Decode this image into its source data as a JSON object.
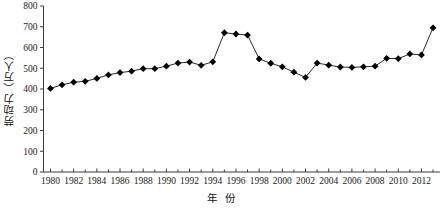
{
  "chart_data": {
    "type": "line",
    "title": "",
    "xlabel": "年 份",
    "ylabel": "劳动力（万人）",
    "ylim": [
      0,
      800
    ],
    "xlim": [
      1979.4,
      2013.6
    ],
    "grid": false,
    "legend": "none",
    "marker": "filled-diamond",
    "y_ticks": [
      0,
      100,
      200,
      300,
      400,
      500,
      600,
      700,
      800
    ],
    "x_ticks": [
      1980,
      1982,
      1984,
      1986,
      1988,
      1990,
      1992,
      1994,
      1996,
      1998,
      2000,
      2002,
      2004,
      2006,
      2008,
      2010,
      2012
    ],
    "x_tick_labels": [
      "1980",
      "1982",
      "1984",
      "1986",
      "1988",
      "1990",
      "1992",
      "1994",
      "1996",
      "1998",
      "2000",
      "2002",
      "2004",
      "2006",
      "2008",
      "2010",
      "2012"
    ],
    "y_tick_labels": [
      "0",
      "100",
      "200",
      "300",
      "400",
      "500",
      "600",
      "700",
      "800"
    ],
    "x": [
      1980,
      1981,
      1982,
      1983,
      1984,
      1985,
      1986,
      1987,
      1988,
      1989,
      1990,
      1991,
      1992,
      1993,
      1994,
      1995,
      1996,
      1997,
      1998,
      1999,
      2000,
      2001,
      2002,
      2003,
      2004,
      2005,
      2006,
      2007,
      2008,
      2009,
      2010,
      2011,
      2012,
      2013
    ],
    "values": [
      403,
      420,
      433,
      437,
      451,
      468,
      479,
      486,
      498,
      498,
      510,
      525,
      530,
      514,
      531,
      671,
      665,
      660,
      545,
      524,
      507,
      481,
      456,
      525,
      515,
      506,
      504,
      507,
      510,
      548,
      546,
      569,
      564,
      695
    ],
    "series": [
      {
        "name": "劳动力",
        "values": [
          403,
          420,
          433,
          437,
          451,
          468,
          479,
          486,
          498,
          498,
          510,
          525,
          530,
          514,
          531,
          671,
          665,
          660,
          545,
          524,
          507,
          481,
          456,
          525,
          515,
          506,
          504,
          507,
          510,
          548,
          546,
          569,
          564,
          695
        ]
      }
    ],
    "line_color": "#141414",
    "marker_color": "#000000"
  }
}
